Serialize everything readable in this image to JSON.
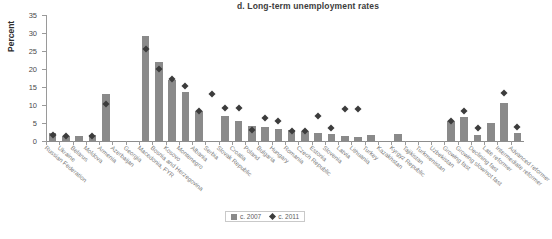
{
  "chart_data": {
    "type": "bar",
    "title": "d. Long-term unemployment rates",
    "xlabel": "",
    "ylabel": "Percent",
    "ylim": [
      0,
      35
    ],
    "yticks": [
      0,
      5,
      10,
      15,
      20,
      25,
      30,
      35
    ],
    "grid": false,
    "legend_position": "bottom-center",
    "categories": [
      "Russian Federation",
      "Ukraine",
      "Belarus",
      "Moldova",
      "Armenia",
      "Azerbaijan",
      "Georgia",
      "Macedonia, FYR",
      "Bosnia and Herzegovina",
      "Kosovo",
      "Montenegro",
      "Albania",
      "Serbia",
      "Slovak Republic",
      "Croatia",
      "Poland",
      "Bulgaria",
      "Hungary",
      "Romania",
      "Czech Republic",
      "Estonia",
      "Slovenia",
      "Latvia",
      "Lithuania",
      "Turkey",
      "Kazakhstan",
      "Kyrgyz Republic",
      "Tajikistan",
      "Turkmenistan",
      "Uzbekistan",
      "Growing fast",
      "Growing slow/not fast",
      "Declining fast",
      "Late reformer",
      "Intermediate reformer",
      "Advanced reformer"
    ],
    "series": [
      {
        "name": "c. 2007",
        "marker": "square",
        "color": "#8a8a8a",
        "values": [
          2.2,
          1.5,
          1.4,
          1.8,
          13.1,
          null,
          null,
          29.2,
          21.9,
          17.0,
          13.5,
          8.4,
          null,
          7.0,
          5.6,
          4.1,
          4.0,
          3.3,
          3.0,
          2.9,
          2.1,
          1.9,
          1.4,
          1.1,
          1.8,
          null,
          2.0,
          null,
          null,
          null,
          5.6,
          6.7,
          1.6,
          4.9,
          10.5,
          2.3
        ]
      },
      {
        "name": "c. 2011",
        "marker": "diamond",
        "color": "#3c3c3c",
        "values": [
          1.8,
          1.3,
          null,
          1.4,
          10.3,
          null,
          null,
          25.5,
          19.9,
          17.2,
          15.2,
          8.3,
          13.1,
          9.2,
          9.2,
          3.1,
          6.4,
          5.6,
          2.9,
          2.7,
          7.0,
          3.6,
          8.9,
          8.8,
          null,
          null,
          null,
          null,
          null,
          null,
          5.6,
          8.3,
          3.7,
          null,
          13.4,
          4.0
        ]
      }
    ]
  },
  "legend": {
    "items": [
      {
        "label": "c. 2007",
        "marker": "square"
      },
      {
        "label": "c. 2011",
        "marker": "diamond"
      }
    ]
  }
}
